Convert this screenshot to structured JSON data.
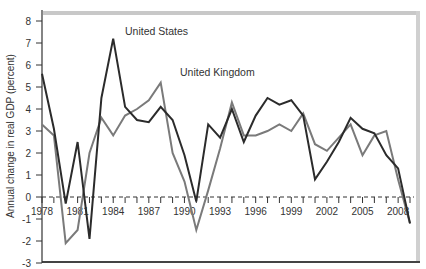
{
  "chart_data": {
    "type": "line",
    "title": "",
    "xlabel": "",
    "ylabel": "Annual change in real GDP (percent)",
    "ylim": [
      -3,
      8
    ],
    "xlim": [
      1978,
      2009
    ],
    "grid": false,
    "legend_position": "inline annotations",
    "y_ticks": [
      -3,
      -2,
      -1,
      0,
      1,
      2,
      3,
      4,
      5,
      6,
      7,
      8
    ],
    "x_tick_labels": [
      "1978",
      "1981",
      "1984",
      "1987",
      "1990",
      "1993",
      "1996",
      "1999",
      "2002",
      "2005",
      "2008"
    ],
    "x": [
      1978,
      1979,
      1980,
      1981,
      1982,
      1983,
      1984,
      1985,
      1986,
      1987,
      1988,
      1989,
      1990,
      1991,
      1992,
      1993,
      1994,
      1995,
      1996,
      1997,
      1998,
      1999,
      2000,
      2001,
      2002,
      2003,
      2004,
      2005,
      2006,
      2007,
      2008,
      2009
    ],
    "series": [
      {
        "name": "United States",
        "color": "#2b2b2b",
        "values": [
          5.6,
          3.1,
          -0.3,
          2.5,
          -1.9,
          4.5,
          7.2,
          4.1,
          3.5,
          3.4,
          4.1,
          3.5,
          1.9,
          -0.2,
          3.3,
          2.7,
          4.0,
          2.5,
          3.7,
          4.5,
          4.2,
          4.4,
          3.7,
          0.8,
          1.6,
          2.5,
          3.6,
          3.1,
          2.9,
          1.9,
          1.3,
          -1.2
        ]
      },
      {
        "name": "United Kingdom",
        "color": "#7a7a7a",
        "values": [
          3.3,
          2.8,
          -2.1,
          -1.5,
          2.0,
          3.6,
          2.8,
          3.7,
          4.0,
          4.4,
          5.2,
          2.0,
          0.7,
          -1.5,
          0.3,
          2.2,
          4.3,
          2.8,
          2.8,
          3.0,
          3.3,
          3.0,
          3.8,
          2.4,
          2.1,
          2.7,
          3.3,
          1.9,
          2.8,
          3.0,
          0.8,
          -1.2
        ]
      }
    ],
    "annotations": [
      {
        "text": "United States",
        "x": 1982.0,
        "y": 7.6
      },
      {
        "text": "United Kingdom",
        "x": 1990.5,
        "y": 5.6
      }
    ]
  }
}
